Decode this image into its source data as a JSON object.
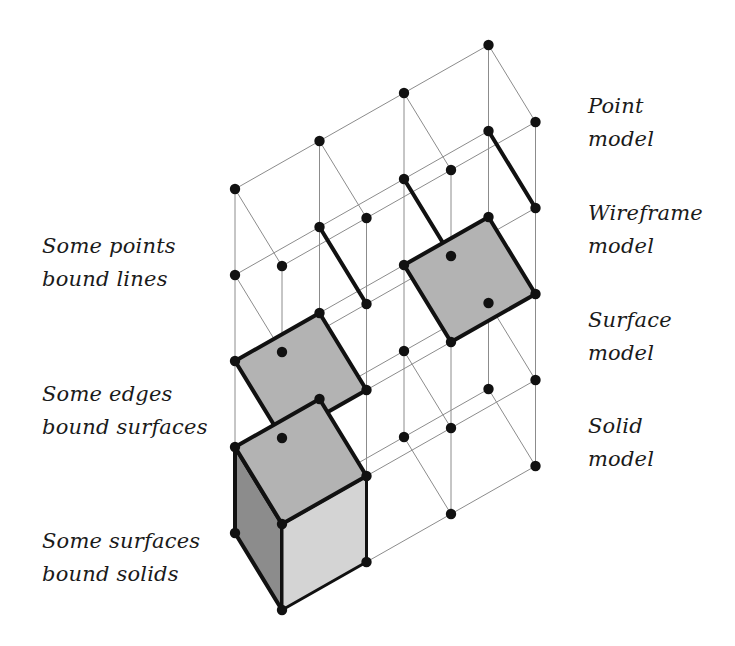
{
  "colors": {
    "background": "#ffffff",
    "grid_line": "#8c8c8c",
    "point": "#111111",
    "bold_edge": "#111111",
    "surface_fill": "#b3b3b3",
    "solid_top": "#b3b3b3",
    "solid_left": "#8c8c8c",
    "solid_front": "#d4d4d4",
    "text": "#1a1a1a"
  },
  "geometry": {
    "origin": [
      235,
      189
    ],
    "i_step": [
      84.5,
      -48
    ],
    "j_step": [
      47,
      77
    ],
    "level_step": 86,
    "i_count": 4,
    "j_count": 2,
    "levels": 5
  },
  "right_labels": [
    {
      "line1": "Point",
      "line2": "model",
      "x": 588,
      "y": 90
    },
    {
      "line1": "Wireframe",
      "line2": "model",
      "x": 588,
      "y": 197
    },
    {
      "line1": "Surface",
      "line2": "model",
      "x": 588,
      "y": 304
    },
    {
      "line1": "Solid",
      "line2": "model",
      "x": 588,
      "y": 410
    }
  ],
  "left_labels": [
    {
      "line1": "Some points",
      "line2": "bound lines",
      "x": 42,
      "y": 230
    },
    {
      "line1": "Some edges",
      "line2": "bound surfaces",
      "x": 42,
      "y": 378
    },
    {
      "line1": "Some surfaces",
      "line2": "bound solids",
      "x": 42,
      "y": 525
    }
  ],
  "bold_edges": [
    {
      "i": 1,
      "level": 1
    },
    {
      "i": 2,
      "level": 1
    },
    {
      "i": 3,
      "level": 1
    }
  ],
  "surfaces": [
    {
      "i": 0,
      "level": 2
    },
    {
      "i": 2,
      "level": 2
    }
  ],
  "solid": {
    "i": 0,
    "top_level": 3,
    "bottom_level": 4
  }
}
